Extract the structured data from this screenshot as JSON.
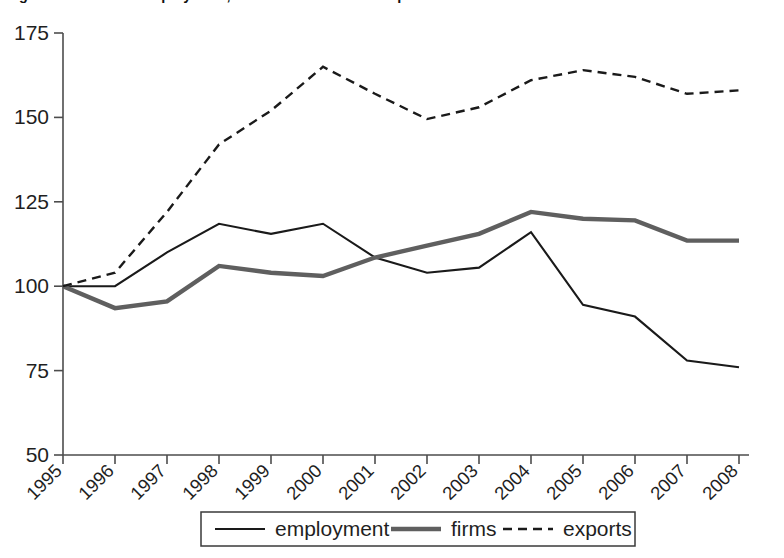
{
  "figure": {
    "cropped_title_fragment": "Figure 2.4   Index of employment, number of firms and exports of the sector",
    "background_color": "#ffffff"
  },
  "chart_data": {
    "type": "line",
    "title": "",
    "xlabel": "",
    "ylabel": "",
    "categories": [
      "1995",
      "1996",
      "1997",
      "1998",
      "1999",
      "2000",
      "2001",
      "2002",
      "2003",
      "2004",
      "2005",
      "2006",
      "2007",
      "2008"
    ],
    "x": [
      1995,
      1996,
      1997,
      1998,
      1999,
      2000,
      2001,
      2002,
      2003,
      2004,
      2005,
      2006,
      2007,
      2008
    ],
    "series": [
      {
        "name": "employment",
        "style": "solid-thin",
        "color": "#1a1a1a",
        "values": [
          100,
          100,
          110,
          118.5,
          115.5,
          118.5,
          108.5,
          104,
          105.5,
          116,
          94.5,
          91,
          78,
          76
        ]
      },
      {
        "name": "firms",
        "style": "solid-thick",
        "color": "#5f5f5f",
        "values": [
          100,
          93.5,
          95.5,
          106,
          104,
          103,
          108.5,
          112,
          115.5,
          122,
          120,
          119.5,
          113.5,
          113.5
        ]
      },
      {
        "name": "exports",
        "style": "dashed",
        "color": "#1a1a1a",
        "values": [
          100,
          104,
          122,
          142,
          152,
          165,
          157,
          149.5,
          153,
          161,
          164,
          162,
          157,
          158
        ]
      }
    ],
    "ylim": [
      50,
      175
    ],
    "yticks": [
      50,
      75,
      100,
      125,
      150,
      175
    ],
    "ytick_labels": [
      "50",
      "75",
      "100",
      "125",
      "150",
      "175"
    ],
    "xtick_rotation_degrees": 45,
    "grid": false,
    "legend_position": "bottom-center",
    "legend_entries": [
      "employment",
      "firms",
      "exports"
    ]
  }
}
